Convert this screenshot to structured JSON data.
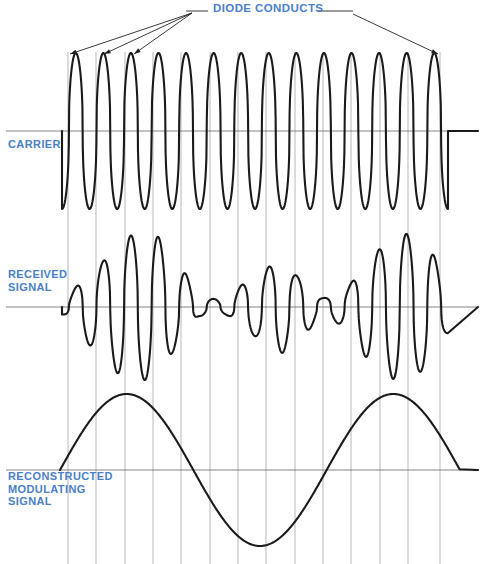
{
  "figure": {
    "width": 487,
    "height": 564,
    "background": "#ffffff",
    "label_color": "#4a7fc8",
    "trace_color": "#1a1a1a",
    "axis_color": "#666666",
    "grid_color": "#888888"
  },
  "labels": {
    "diode_conducts": "DIODE CONDUCTS",
    "carrier": "CARRIER",
    "received_signal": "RECEIVED\nSIGNAL",
    "reconstructed": "RECONSTRUCTED\nMODULATING\nSIGNAL"
  },
  "annotations": {
    "leader_left_x": 208,
    "leader_right_x": 318,
    "leader_y": 11,
    "fan_origin_x": 192,
    "fan_origin_y": 13,
    "arrow_targets": [
      {
        "x": 70,
        "y": 54
      },
      {
        "x": 104,
        "y": 54
      },
      {
        "x": 134,
        "y": 54
      },
      {
        "x": 438,
        "y": 54
      }
    ],
    "right_leader_elbow_x": 353,
    "right_leader_elbow_y": 14
  },
  "grid": {
    "x_start": 68,
    "x_end": 440,
    "count": 14,
    "spacing": 28.6,
    "top": 52,
    "bottom": 564,
    "positions": [
      68,
      96,
      125,
      153,
      181,
      210,
      238,
      266,
      295,
      323,
      351,
      380,
      408,
      440
    ]
  },
  "chart_data": {
    "type": "line",
    "xlabel": "",
    "ylabel": "",
    "grid": true,
    "legend": "none",
    "plot_x_range": [
      60,
      470
    ],
    "panels": [
      {
        "name": "carrier",
        "label": "CARRIER",
        "baseline_y": 131,
        "peak_y": 54,
        "trough_y": 214,
        "amplitude": 78,
        "wave_start_x": 62,
        "wave_end_x": 448,
        "flat_tail_end_x": 478,
        "cycles": 14,
        "waveform": "constant-amplitude square-ish sine (unmodulated carrier)",
        "description": "High-frequency carrier of constant amplitude with rounded flat-topped peaks."
      },
      {
        "name": "received_signal",
        "label": "RECEIVED SIGNAL",
        "baseline_y": 307,
        "max_peak_y": 232,
        "max_trough_y": 382,
        "amplitude": 75,
        "wave_start_x": 62,
        "wave_end_x": 448,
        "flat_tail_end_x": 478,
        "cycles": 14,
        "waveform": "amplitude modulated carrier",
        "envelope_note": "Envelope follows the modulating sine: large near x=130 and x=400, near zero near x=200 and x=330.",
        "envelope_samples": [
          {
            "x": 62,
            "a": 0.1
          },
          {
            "x": 96,
            "a": 0.55
          },
          {
            "x": 125,
            "a": 0.95
          },
          {
            "x": 153,
            "a": 0.98
          },
          {
            "x": 181,
            "a": 0.5
          },
          {
            "x": 200,
            "a": 0.12
          },
          {
            "x": 224,
            "a": 0.1
          },
          {
            "x": 252,
            "a": 0.38
          },
          {
            "x": 280,
            "a": 0.62
          },
          {
            "x": 300,
            "a": 0.4
          },
          {
            "x": 323,
            "a": 0.12
          },
          {
            "x": 345,
            "a": 0.25
          },
          {
            "x": 370,
            "a": 0.7
          },
          {
            "x": 400,
            "a": 1.0
          },
          {
            "x": 425,
            "a": 0.85
          },
          {
            "x": 448,
            "a": 0.35
          }
        ]
      },
      {
        "name": "reconstructed_modulating_signal",
        "label": "RECONSTRUCTED MODULATING SIGNAL",
        "baseline_y": 470,
        "peak_y": 394,
        "trough_y": 548,
        "amplitude": 76,
        "wave_start_x": 60,
        "wave_end_x": 460,
        "flat_tail_end_x": 478,
        "cycles": 1.5,
        "waveform": "low-frequency sine (recovered audio)",
        "key_points": [
          {
            "x": 60,
            "y": 470,
            "note": "zero crossing rising"
          },
          {
            "x": 125,
            "y": 394,
            "note": "positive peak"
          },
          {
            "x": 200,
            "y": 470,
            "note": "zero crossing falling"
          },
          {
            "x": 265,
            "y": 548,
            "note": "negative peak"
          },
          {
            "x": 330,
            "y": 470,
            "note": "zero crossing rising"
          },
          {
            "x": 400,
            "y": 394,
            "note": "positive peak"
          },
          {
            "x": 460,
            "y": 470,
            "note": "zero crossing falling"
          }
        ]
      }
    ]
  }
}
